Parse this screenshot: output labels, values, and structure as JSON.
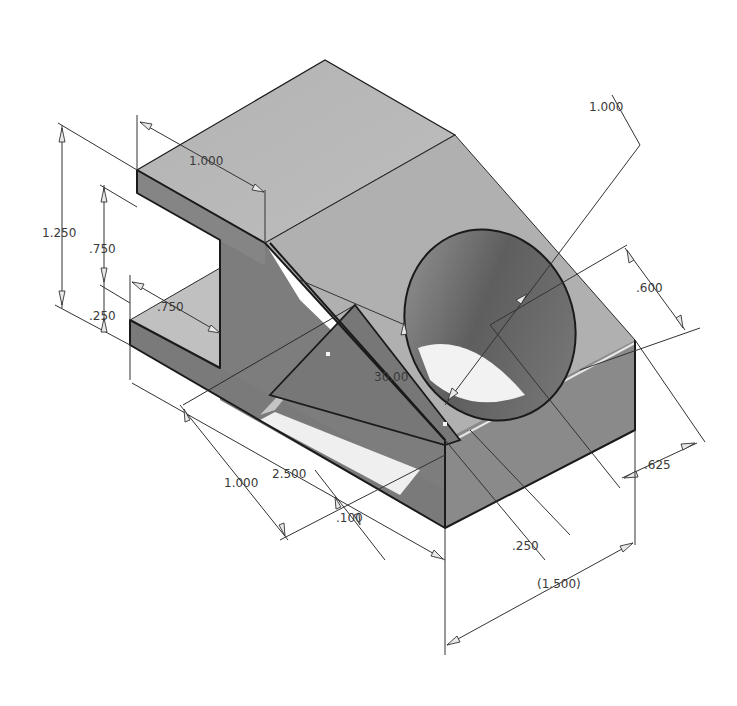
{
  "drawing": {
    "view": "isometric",
    "units": "inch",
    "colors": {
      "background": "#ffffff",
      "top_face": "#b8b8b8",
      "dark_face": "#7f7f7f",
      "mid_face": "#9a9a9a",
      "light_face": "#c4c4c4",
      "hole_inner": "#6e6e6e",
      "edge": "#1a1a1a"
    },
    "dimensions": {
      "overall_height": "1.250",
      "slot_height": ".750",
      "base_thickness": ".250",
      "top_arm_depth": "1.000",
      "slot_depth": ".750",
      "hole_diameter": "1.000",
      "hole_center_offset": ".600",
      "rib_angle": "30.00",
      "width_front": "1.000",
      "length_overall": "2.500",
      "rib_thickness": ".100",
      "rib_offset": ".250",
      "hole_edge_offset": ".625",
      "reference_width": "(1.500)"
    }
  }
}
